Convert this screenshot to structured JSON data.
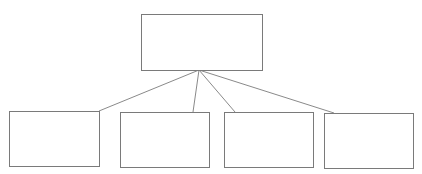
{
  "diagram": {
    "type": "org-chart",
    "colors": {
      "background": "#ffffff",
      "box_border": "#7a7a7a",
      "connector": "#8a8a8a"
    },
    "root": {
      "label": "",
      "x": 141,
      "y": 14,
      "w": 121,
      "h": 56
    },
    "connector_origin": {
      "x": 199,
      "y": 70
    },
    "children": [
      {
        "label": "",
        "x": 9,
        "y": 111,
        "w": 90,
        "h": 55,
        "anchor": {
          "x": 99,
          "y": 111
        }
      },
      {
        "label": "",
        "x": 120,
        "y": 112,
        "w": 89,
        "h": 55,
        "anchor": {
          "x": 193,
          "y": 112
        }
      },
      {
        "label": "",
        "x": 224,
        "y": 112,
        "w": 89,
        "h": 55,
        "anchor": {
          "x": 235,
          "y": 112
        }
      },
      {
        "label": "",
        "x": 324,
        "y": 113,
        "w": 89,
        "h": 55,
        "anchor": {
          "x": 334,
          "y": 113
        }
      }
    ]
  }
}
